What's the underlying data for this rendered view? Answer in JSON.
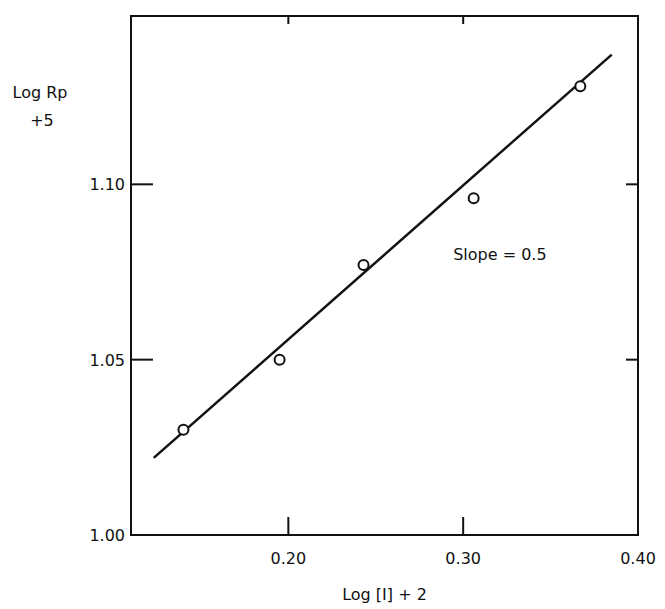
{
  "chart_data": {
    "type": "scatter",
    "title": "",
    "xlabel": "Log [I] + 2",
    "ylabel_line1": "Log Rp",
    "ylabel_line2": "+5",
    "xlim": [
      0.11,
      0.4
    ],
    "ylim": [
      1.0,
      1.148
    ],
    "xticks": [
      0.2,
      0.3,
      0.4
    ],
    "xtick_labels": [
      "0.20",
      "0.30",
      "0.40"
    ],
    "yticks": [
      1.0,
      1.05,
      1.1
    ],
    "ytick_labels": [
      "1.00",
      "1.05",
      "1.10"
    ],
    "grid": false,
    "series": [
      {
        "name": "data",
        "marker": "open-circle",
        "x": [
          0.14,
          0.195,
          0.243,
          0.306,
          0.367
        ],
        "y": [
          1.03,
          1.05,
          1.077,
          1.096,
          1.128
        ]
      },
      {
        "name": "fit",
        "style": "line",
        "x": [
          0.123,
          0.385
        ],
        "y": [
          1.022,
          1.137
        ]
      }
    ],
    "annotations": [
      {
        "text": "Slope = 0.5",
        "x": 0.3,
        "y": 1.08
      }
    ]
  }
}
